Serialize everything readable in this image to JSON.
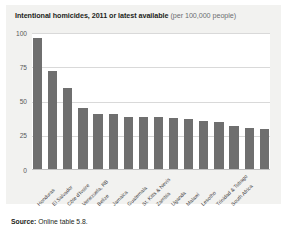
{
  "chart_data": {
    "type": "bar",
    "title": "Intentional homicides, 2011 or latest available (per 100,000 people)",
    "title_main": "Intentional homicides, 2011 or latest available",
    "title_unit": "(per 100,000 people)",
    "xlabel": "",
    "ylabel": "",
    "ylim": [
      0,
      100
    ],
    "yticks": [
      0,
      25,
      50,
      75,
      100
    ],
    "ytick_labels": [
      "0",
      "25",
      "50",
      "75",
      "100"
    ],
    "grid": true,
    "legend": false,
    "bar_color": "#6f6f6f",
    "gridline_color": "#d9d9d9",
    "categories": [
      "Honduras",
      "El Salvador",
      "Côte d'Ivoire",
      "Venezuela, RB",
      "Belize",
      "Jamaica",
      "Guatemala",
      "St. Kitts & Nevis",
      "Zambia",
      "Uganda",
      "Malawi",
      "Lesotho",
      "Trinidad & Tobago",
      "South Africa"
    ],
    "values": [
      96,
      72,
      60,
      45,
      41,
      41,
      39,
      39,
      39,
      38,
      37,
      36,
      35,
      32
    ]
  },
  "footer": {
    "source_label": "Source:",
    "source_value": "Online table 5.8."
  }
}
